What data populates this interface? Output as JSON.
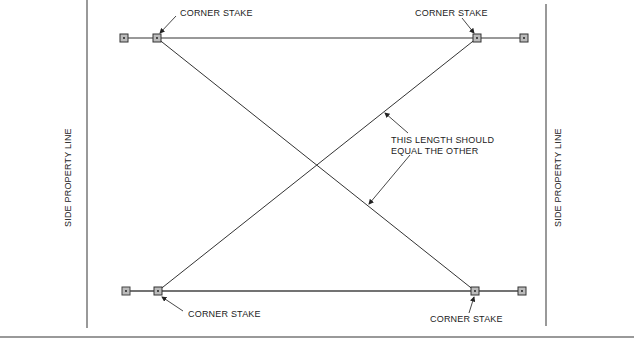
{
  "diagram": {
    "labels": {
      "corner_top_left": "CORNER STAKE",
      "corner_top_right": "CORNER STAKE",
      "corner_bottom_left": "CORNER STAKE",
      "corner_bottom_right": "CORNER STAKE",
      "diagonal_note_line1": "THIS LENGTH SHOULD",
      "diagonal_note_line2": "EQUAL THE OTHER",
      "side_left": "SIDE PROPERTY LINE",
      "side_right": "SIDE PROPERTY LINE"
    },
    "stakes": [
      {
        "id": "batter-top-left",
        "x": 124,
        "y": 38
      },
      {
        "id": "corner-top-left",
        "x": 157,
        "y": 38
      },
      {
        "id": "corner-top-right",
        "x": 477,
        "y": 38
      },
      {
        "id": "batter-top-right",
        "x": 524,
        "y": 38
      },
      {
        "id": "batter-bottom-left",
        "x": 126,
        "y": 291
      },
      {
        "id": "corner-bottom-left",
        "x": 158,
        "y": 291
      },
      {
        "id": "corner-bottom-right",
        "x": 475,
        "y": 291
      },
      {
        "id": "batter-bottom-right",
        "x": 522,
        "y": 291
      }
    ],
    "colors": {
      "line": "#333333",
      "stake_fill": "#b9b9b9",
      "text": "#222222"
    }
  }
}
